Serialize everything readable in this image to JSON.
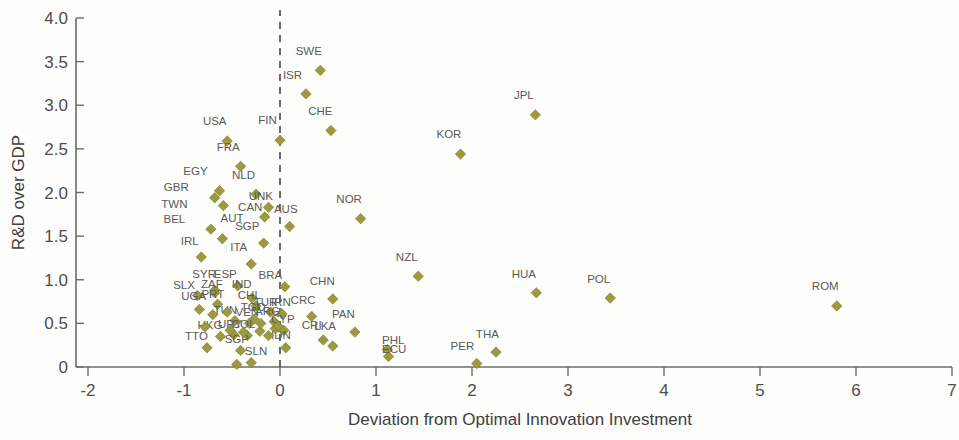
{
  "chart_data": {
    "type": "scatter",
    "title": "",
    "xlabel": "Deviation from Optimal  Innovation Investment",
    "ylabel": "R&D over GDP",
    "xlim": [
      -2,
      7
    ],
    "ylim": [
      0,
      4.0
    ],
    "xticks": [
      "-2",
      "-1",
      "0",
      "1",
      "2",
      "3",
      "4",
      "5",
      "6",
      "7"
    ],
    "xtick_values": [
      -2,
      -1,
      0,
      1,
      2,
      3,
      4,
      5,
      6,
      7
    ],
    "yticks": [
      "0",
      "0.5",
      "1.0",
      "1.5",
      "2.0",
      "2.5",
      "3.0",
      "3.5",
      "4.0"
    ],
    "ytick_values": [
      0,
      0.5,
      1.0,
      1.5,
      2.0,
      2.5,
      3.0,
      3.5,
      4.0
    ],
    "grid": false,
    "legend": "none",
    "marker_color": "#9a9a3e",
    "marker_shape": "diamond",
    "annotations": [
      {
        "text": "vertical dashed reference line at x = 0",
        "x": 0
      }
    ],
    "points": [
      {
        "label": "SWE",
        "x": 0.42,
        "y": 3.4,
        "lx": 0.3,
        "ly": 3.58
      },
      {
        "label": "ISR",
        "x": 0.27,
        "y": 3.13,
        "lx": 0.13,
        "ly": 3.3
      },
      {
        "label": "JPL",
        "x": 2.66,
        "y": 2.89,
        "lx": 2.54,
        "ly": 3.07
      },
      {
        "label": "CHE",
        "x": 0.53,
        "y": 2.71,
        "lx": 0.42,
        "ly": 2.89
      },
      {
        "label": "FIN",
        "x": 0.0,
        "y": 2.6,
        "lx": -0.13,
        "ly": 2.78
      },
      {
        "label": "USA",
        "x": -0.55,
        "y": 2.59,
        "lx": -0.68,
        "ly": 2.77
      },
      {
        "label": "KOR",
        "x": 1.88,
        "y": 2.44,
        "lx": 1.76,
        "ly": 2.62
      },
      {
        "label": "FRA",
        "x": -0.41,
        "y": 2.3,
        "lx": -0.54,
        "ly": 2.48
      },
      {
        "label": "EGY",
        "x": -0.63,
        "y": 2.02,
        "lx": -0.88,
        "ly": 2.2
      },
      {
        "label": "NLD",
        "x": -0.25,
        "y": 1.98,
        "lx": -0.38,
        "ly": 2.16
      },
      {
        "label": "GBR",
        "x": -0.68,
        "y": 1.94,
        "lx": -1.08,
        "ly": 2.02
      },
      {
        "label": "UNK",
        "x": -0.12,
        "y": 1.83,
        "lx": -0.2,
        "ly": 1.91
      },
      {
        "label": "TWN",
        "x": -0.59,
        "y": 1.85,
        "lx": -1.1,
        "ly": 1.82
      },
      {
        "label": "CAN",
        "x": -0.16,
        "y": 1.72,
        "lx": -0.31,
        "ly": 1.79
      },
      {
        "label": "AUS",
        "x": 0.1,
        "y": 1.61,
        "lx": 0.06,
        "ly": 1.77
      },
      {
        "label": "BEL",
        "x": -0.72,
        "y": 1.58,
        "lx": -1.1,
        "ly": 1.65
      },
      {
        "label": "AUT",
        "x": -0.6,
        "y": 1.47,
        "lx": -0.5,
        "ly": 1.66
      },
      {
        "label": "SGP",
        "x": -0.17,
        "y": 1.42,
        "lx": -0.34,
        "ly": 1.57
      },
      {
        "label": "NOR",
        "x": 0.84,
        "y": 1.7,
        "lx": 0.72,
        "ly": 1.88
      },
      {
        "label": "IRL",
        "x": -0.82,
        "y": 1.26,
        "lx": -0.94,
        "ly": 1.4
      },
      {
        "label": "ITA",
        "x": -0.3,
        "y": 1.18,
        "lx": -0.43,
        "ly": 1.33
      },
      {
        "label": "NZL",
        "x": 1.44,
        "y": 1.04,
        "lx": 1.32,
        "ly": 1.22
      },
      {
        "label": "ESP",
        "x": -0.44,
        "y": 0.93,
        "lx": -0.57,
        "ly": 1.02
      },
      {
        "label": "SYR",
        "x": -0.68,
        "y": 0.88,
        "lx": -0.79,
        "ly": 1.02
      },
      {
        "label": "BRA",
        "x": 0.05,
        "y": 0.92,
        "lx": -0.1,
        "ly": 1.01
      },
      {
        "label": "HUA",
        "x": 2.67,
        "y": 0.85,
        "lx": 2.54,
        "ly": 1.02
      },
      {
        "label": "ZAF",
        "x": -0.68,
        "y": 0.85,
        "lx": -0.71,
        "ly": 0.91
      },
      {
        "label": "SLX",
        "x": -0.86,
        "y": 0.82,
        "lx": -1.0,
        "ly": 0.89
      },
      {
        "label": "CHN",
        "x": 0.55,
        "y": 0.78,
        "lx": 0.44,
        "ly": 0.94
      },
      {
        "label": "POL",
        "x": 3.44,
        "y": 0.79,
        "lx": 3.32,
        "ly": 0.96
      },
      {
        "label": "IND",
        "x": -0.29,
        "y": 0.79,
        "lx": -0.4,
        "ly": 0.9
      },
      {
        "label": "ROM",
        "x": 5.8,
        "y": 0.7,
        "lx": 5.68,
        "ly": 0.88
      },
      {
        "label": "PRT",
        "x": -0.65,
        "y": 0.72,
        "lx": -0.7,
        "ly": 0.79
      },
      {
        "label": "CHL",
        "x": -0.25,
        "y": 0.7,
        "lx": -0.32,
        "ly": 0.78
      },
      {
        "label": "UGA",
        "x": -0.84,
        "y": 0.66,
        "lx": -0.9,
        "ly": 0.77
      },
      {
        "label": "TUR",
        "x": -0.1,
        "y": 0.63,
        "lx": -0.15,
        "ly": 0.7
      },
      {
        "label": "IRN",
        "x": 0.02,
        "y": 0.61,
        "lx": 0.01,
        "ly": 0.7
      },
      {
        "label": "CRC",
        "x": 0.33,
        "y": 0.58,
        "lx": 0.24,
        "ly": 0.72
      },
      {
        "label": "TUN",
        "x": -0.47,
        "y": 0.53,
        "lx": -0.57,
        "ly": 0.61
      },
      {
        "label": "ARG",
        "x": -0.06,
        "y": 0.52,
        "lx": -0.13,
        "ly": 0.6
      },
      {
        "label": "VEN",
        "x": -0.32,
        "y": 0.5,
        "lx": -0.34,
        "ly": 0.58
      },
      {
        "label": "TGO",
        "x": -0.27,
        "y": 0.55,
        "lx": -0.28,
        "ly": 0.64
      },
      {
        "label": "PAN",
        "x": 0.78,
        "y": 0.4,
        "lx": 0.66,
        "ly": 0.56
      },
      {
        "label": "CYP",
        "x": 0.04,
        "y": 0.42,
        "lx": 0.03,
        "ly": 0.5
      },
      {
        "label": "URY",
        "x": -0.48,
        "y": 0.37,
        "lx": -0.52,
        "ly": 0.45
      },
      {
        "label": "HKG",
        "x": -0.62,
        "y": 0.35,
        "lx": -0.73,
        "ly": 0.44
      },
      {
        "label": "COL",
        "x": -0.34,
        "y": 0.36,
        "lx": -0.38,
        "ly": 0.45
      },
      {
        "label": "CRI",
        "x": 0.45,
        "y": 0.31,
        "lx": 0.33,
        "ly": 0.44
      },
      {
        "label": "LKA",
        "x": 0.55,
        "y": 0.24,
        "lx": 0.47,
        "ly": 0.42
      },
      {
        "label": "TTO",
        "x": -0.76,
        "y": 0.22,
        "lx": -0.87,
        "ly": 0.31
      },
      {
        "label": "IDN",
        "x": 0.06,
        "y": 0.22,
        "lx": 0.01,
        "ly": 0.32
      },
      {
        "label": "SGP2",
        "x": -0.41,
        "y": 0.19,
        "lx": -0.45,
        "ly": 0.28
      },
      {
        "label": "PHL",
        "x": 1.12,
        "y": 0.2,
        "lx": 1.18,
        "ly": 0.26
      },
      {
        "label": "ECU",
        "x": 1.13,
        "y": 0.12,
        "lx": 1.19,
        "ly": 0.16
      },
      {
        "label": "THA",
        "x": 2.25,
        "y": 0.17,
        "lx": 2.16,
        "ly": 0.33
      },
      {
        "label": "PER",
        "x": 2.05,
        "y": 0.04,
        "lx": 1.9,
        "ly": 0.2
      },
      {
        "label": "SLN",
        "x": -0.3,
        "y": 0.05,
        "lx": -0.25,
        "ly": 0.14
      },
      {
        "label": "DZA",
        "x": -0.45,
        "y": 0.03,
        "lx": -0.45,
        "ly": 0.03
      },
      {
        "label": "BOL",
        "x": -0.52,
        "y": 0.42,
        "lx": -0.52,
        "ly": 0.42
      },
      {
        "label": "KEN",
        "x": -0.38,
        "y": 0.4,
        "lx": -0.38,
        "ly": 0.4
      },
      {
        "label": "MEX",
        "x": -0.21,
        "y": 0.41,
        "lx": -0.21,
        "ly": 0.41
      },
      {
        "label": "EST",
        "x": -0.05,
        "y": 0.44,
        "lx": -0.05,
        "ly": 0.44
      },
      {
        "label": "JOR",
        "x": -0.12,
        "y": 0.36,
        "lx": -0.12,
        "ly": 0.36
      },
      {
        "label": "MAR",
        "x": -0.7,
        "y": 0.6,
        "lx": -0.7,
        "ly": 0.6
      },
      {
        "label": "GRC",
        "x": -0.55,
        "y": 0.63,
        "lx": -0.55,
        "ly": 0.63
      },
      {
        "label": "PAK",
        "x": -0.78,
        "y": 0.46,
        "lx": -0.78,
        "ly": 0.46
      },
      {
        "label": "BGR",
        "x": -0.2,
        "y": 0.5,
        "lx": -0.2,
        "ly": 0.5
      },
      {
        "label": "SVK",
        "x": -0.02,
        "y": 0.47,
        "lx": -0.02,
        "ly": 0.47
      }
    ]
  },
  "axes": {
    "x_title": "Deviation from Optimal  Innovation Investment",
    "y_title": "R&D over GDP"
  }
}
